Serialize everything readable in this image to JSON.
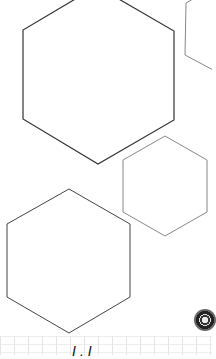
{
  "canvas": {
    "shapes": [
      {
        "type": "hexagon",
        "name": "large-hexagon",
        "stroke": "#333333"
      },
      {
        "type": "hexagon",
        "name": "partial-hexagon-top-right",
        "stroke": "#888888"
      },
      {
        "type": "hexagon",
        "name": "medium-hexagon",
        "stroke": "#888888"
      },
      {
        "type": "hexagon",
        "name": "lower-hexagon",
        "stroke": "#444444"
      }
    ]
  },
  "bottom_strip": {
    "label": "I.I"
  },
  "fab": {
    "icon": "circular-control-icon"
  }
}
